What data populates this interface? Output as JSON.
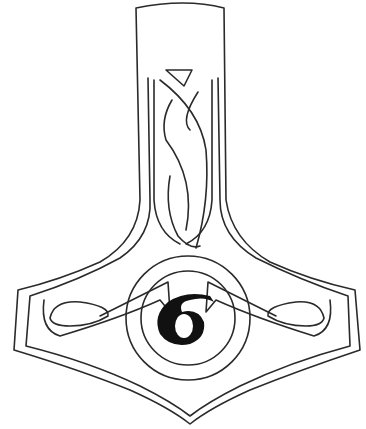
{
  "image": {
    "subject": "Mjolnir hammer pendant line art",
    "center_glyph": "6",
    "line_color": "#2a2a2a",
    "background": "#ffffff"
  }
}
